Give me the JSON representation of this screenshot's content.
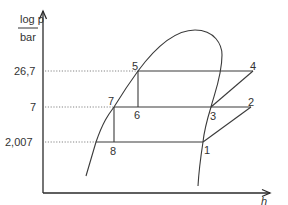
{
  "diagram": {
    "type": "log p-h refrigeration cycle diagram",
    "y_axis": {
      "label_top": "log p",
      "label_bottom": "bar"
    },
    "x_axis": {
      "label": "h"
    },
    "pressure_levels": [
      {
        "label": "26,7",
        "y": 71
      },
      {
        "label": "7",
        "y": 107
      },
      {
        "label": "2,007",
        "y": 142
      }
    ],
    "points": [
      {
        "id": "1",
        "label": "1"
      },
      {
        "id": "2",
        "label": "2"
      },
      {
        "id": "3",
        "label": "3"
      },
      {
        "id": "4",
        "label": "4"
      },
      {
        "id": "5",
        "label": "5"
      },
      {
        "id": "6",
        "label": "6"
      },
      {
        "id": "7",
        "label": "7"
      },
      {
        "id": "8",
        "label": "8"
      }
    ],
    "colors": {
      "line": "#3a3a3a",
      "dotted": "#666666",
      "text": "#333333"
    }
  }
}
